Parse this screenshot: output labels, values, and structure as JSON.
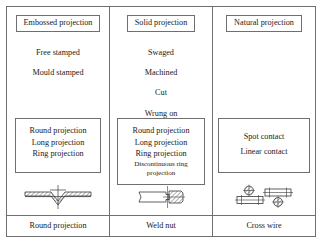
{
  "figure": {
    "columns": [
      {
        "header": "Embossed projection",
        "methods": [
          "Free stamped",
          "Mould stamped"
        ],
        "details": [
          "Round projection",
          "Long projection",
          "Ring projection"
        ],
        "details_small": [],
        "diagram_icon": "sheet-with-round-projection-section",
        "caption": "Round projection"
      },
      {
        "header": "Solid projection",
        "methods": [
          "Swaged",
          "Machined",
          "Cut",
          "Wrung on"
        ],
        "details": [
          "Round projection",
          "Long projection",
          "Ring projection"
        ],
        "details_small": [
          "Discontinuous ring projection"
        ],
        "diagram_icon": "weld-nut-section",
        "caption": "Weld nut"
      },
      {
        "header": "Natural projection",
        "methods": [],
        "details": [
          "Spot contact",
          "Linear contact"
        ],
        "details_small": [],
        "diagram_icon": "cross-wire-section",
        "caption": "Cross wire"
      }
    ]
  },
  "colors": {
    "line": "#6f6f6f",
    "text": "#1a1a1a",
    "background": "#ffffff",
    "hatch": "#555555"
  }
}
